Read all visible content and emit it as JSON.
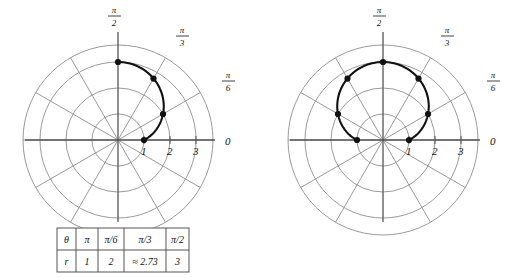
{
  "figure": {
    "title": "",
    "panels": [
      {
        "id": "left-panel",
        "description": "partial polar curve arc from theta 0 to pi/2",
        "center_x": 118,
        "center_y": 140,
        "unit_px": 26,
        "curve_theta_start_deg": 0,
        "curve_theta_end_deg": 90,
        "axis_labels": {
          "zero": "0",
          "pi_over_2_num": "π",
          "pi_over_2_den": "2",
          "pi_over_3_num": "π",
          "pi_over_3_den": "3",
          "pi_over_6_num": "π",
          "pi_over_6_den": "6"
        },
        "radial_ticks": [
          "1",
          "2",
          "3"
        ],
        "marked_points": [
          {
            "theta_deg": 0,
            "r": 1
          },
          {
            "theta_deg": 30,
            "r": 2
          },
          {
            "theta_deg": 60,
            "r": 2.73
          },
          {
            "theta_deg": 90,
            "r": 3
          }
        ]
      },
      {
        "id": "right-panel",
        "description": "complete polar curve limacon",
        "center_x": 383,
        "center_y": 140,
        "unit_px": 26,
        "curve_theta_start_deg": 0,
        "curve_theta_end_deg": 180,
        "axis_labels": {
          "zero": "0",
          "pi_over_2_num": "π",
          "pi_over_2_den": "2",
          "pi_over_3_num": "π",
          "pi_over_3_den": "3",
          "pi_over_6_num": "π",
          "pi_over_6_den": "6"
        },
        "radial_ticks": [
          "1",
          "2",
          "3"
        ],
        "marked_points": [
          {
            "theta_deg": 0,
            "r": 1
          },
          {
            "theta_deg": 30,
            "r": 2
          },
          {
            "theta_deg": 60,
            "r": 2.73
          },
          {
            "theta_deg": 90,
            "r": 3
          },
          {
            "theta_deg": 120,
            "r": 2.73
          },
          {
            "theta_deg": 150,
            "r": 2
          },
          {
            "theta_deg": 180,
            "r": 1
          }
        ]
      }
    ],
    "grid": {
      "circle_count": 4,
      "spoke_count": 12,
      "spoke_step_deg": 30,
      "color": "#8e8e8e"
    },
    "curve_color": "#111111",
    "point_color": "#111111"
  },
  "table": {
    "name": "theta-r-value-table",
    "row_labels": [
      "θ",
      "r"
    ],
    "headers": [
      "θ",
      "π",
      "π/6",
      "π/3",
      "π/2"
    ],
    "values": [
      "r",
      "1",
      "2",
      "≈ 2.73",
      "3"
    ],
    "border_color": "#555555"
  }
}
